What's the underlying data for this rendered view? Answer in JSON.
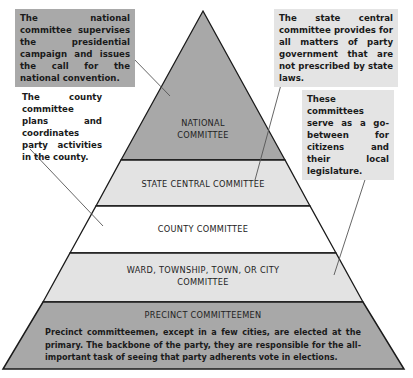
{
  "diagram": {
    "type": "pyramid",
    "levels": [
      {
        "id": "national",
        "label_line1": "NATIONAL",
        "label_line2": "COMMITTEE",
        "fill": "#a8a8a8"
      },
      {
        "id": "state",
        "label": "STATE CENTRAL COMMITTEE",
        "fill": "#e3e3e3"
      },
      {
        "id": "county",
        "label": "COUNTY COMMITTEE",
        "fill": "#ffffff"
      },
      {
        "id": "ward",
        "label_line1": "WARD, TOWNSHIP, TOWN, OR CITY",
        "label_line2": "COMMITTEE",
        "fill": "#e3e3e3"
      },
      {
        "id": "precinct",
        "label": "PRECINCT COMMITTEEMEN",
        "fill": "#a8a8a8",
        "description": "Precinct committeemen, except in a few cities, are elected at the primary. The backbone of the party, they are responsible for the all-important task of seeing that party adherents vote in elections."
      }
    ],
    "notes": [
      {
        "id": "national-note",
        "text": "The national committee supervises the presidential campaign and issues the call for the national convention.",
        "points_to": "national"
      },
      {
        "id": "state-note",
        "text": "The state central committee provides for all matters of party government that are not prescribed by state laws.",
        "points_to": "state"
      },
      {
        "id": "county-note",
        "text": "The county committee plans and coordinates party activities in the county.",
        "points_to": "county"
      },
      {
        "id": "ward-note",
        "text": "These committees serve as a go-between for citizens and their local legislature.",
        "points_to": "ward"
      }
    ],
    "colors": {
      "dark_band": "#a8a8a8",
      "light_band": "#e3e3e3",
      "outline": "#1a1a1a",
      "leader_line": "#555555"
    }
  }
}
